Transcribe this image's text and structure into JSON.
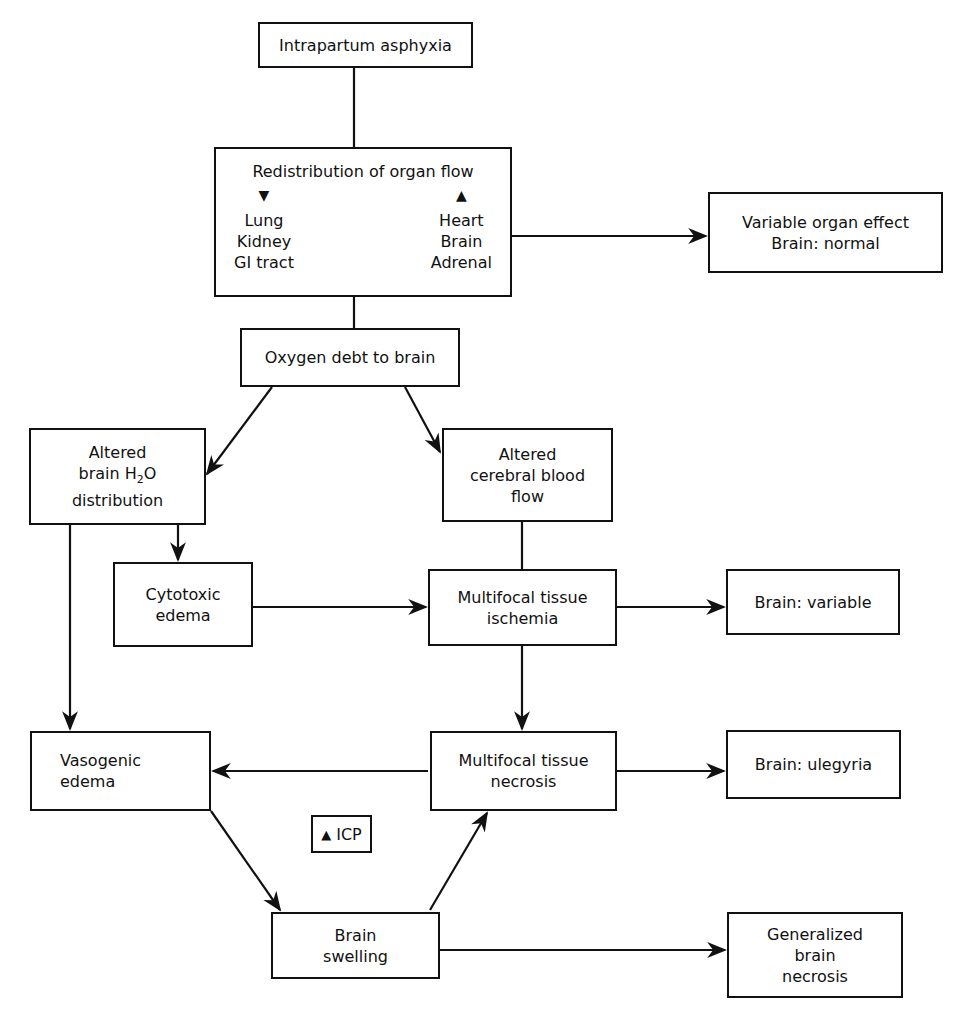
{
  "nodes": {
    "intrapartum": {
      "lines": [
        "Intrapartum asphyxia"
      ]
    },
    "redistribution": {
      "title": "Redistribution of organ flow",
      "decreased": {
        "icon": "arrow-down-icon",
        "items": [
          "Lung",
          "Kidney",
          "GI tract"
        ]
      },
      "increased": {
        "icon": "arrow-up-icon",
        "items": [
          "Heart",
          "Brain",
          "Adrenal"
        ]
      }
    },
    "variable_organ": {
      "lines": [
        "Variable organ effect",
        "Brain: normal"
      ]
    },
    "oxygen_debt": {
      "lines": [
        "Oxygen debt to brain"
      ]
    },
    "altered_h2o": {
      "line1": "Altered",
      "line2a": "brain H",
      "line2sub": "2",
      "line2b": "O",
      "line3": "distribution"
    },
    "altered_cbf": {
      "lines": [
        "Altered",
        "cerebral blood",
        "flow"
      ]
    },
    "cytotoxic": {
      "lines": [
        "Cytotoxic",
        "edema"
      ]
    },
    "ischemia": {
      "lines": [
        "Multifocal tissue",
        "ischemia"
      ]
    },
    "brain_variable": {
      "lines": [
        "Brain: variable"
      ]
    },
    "vasogenic": {
      "lines": [
        "Vasogenic",
        "edema"
      ]
    },
    "necrosis": {
      "lines": [
        "Multifocal tissue",
        "necrosis"
      ]
    },
    "ulegyria": {
      "lines": [
        "Brain: ulegyria"
      ]
    },
    "icp": {
      "icon": "arrow-up-icon",
      "label": "ICP"
    },
    "swelling": {
      "lines": [
        "Brain",
        "swelling"
      ]
    },
    "generalized": {
      "lines": [
        "Generalized",
        "brain",
        "necrosis"
      ]
    }
  },
  "glyphs": {
    "down": "▼",
    "up": "▲"
  }
}
